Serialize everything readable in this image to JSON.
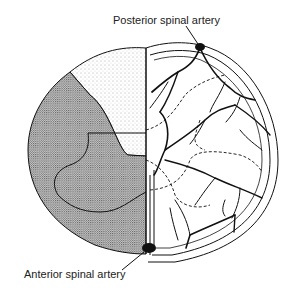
{
  "labels": {
    "posterior": "Posterior spinal artery",
    "anterior": "Anterior spinal artery"
  },
  "figure": {
    "left_half": "stippled territories (light posterior, dense anterior/lateral)",
    "right_half": "arterial branching network with dashed territory boundaries"
  },
  "colors": {
    "ink": "#111111",
    "stipple_light": "#d9d9d9",
    "stipple_dense": "#9a9a9a",
    "background": "#ffffff"
  }
}
